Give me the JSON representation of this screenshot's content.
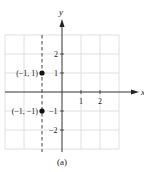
{
  "figure": {
    "caption": "(a)",
    "x_axis_label": "x",
    "y_axis_label": "y",
    "x_ticks": [
      {
        "value": 1,
        "label": "1"
      },
      {
        "value": 2,
        "label": "2"
      }
    ],
    "y_ticks": [
      {
        "value": 2,
        "label": "2"
      },
      {
        "value": 1,
        "label": "1"
      },
      {
        "value": -1,
        "label": "−1"
      },
      {
        "value": -2,
        "label": "−2"
      }
    ],
    "points": [
      {
        "x": -1,
        "y": 1,
        "label": "(−1, 1)"
      },
      {
        "x": -1,
        "y": -1,
        "label": "(−1, −1)"
      }
    ],
    "dashed_line": {
      "equation": "x = -1"
    },
    "grid": {
      "xmin": -3,
      "xmax": 3,
      "ymin": -3,
      "ymax": 3
    },
    "colors": {
      "axis": "#333333",
      "grid": "#d8d8d8",
      "point": "#111111",
      "dashed": "#555555"
    }
  }
}
